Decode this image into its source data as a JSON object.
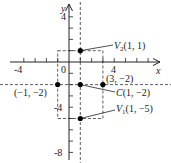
{
  "figure": {
    "type": "coordinate-graph",
    "axes": {
      "x_label": "x",
      "y_label": "y",
      "origin_label": "0",
      "x_ticks_labeled": [
        "-4",
        "4"
      ],
      "y_ticks_labeled": [
        "4",
        "-4",
        "-8"
      ],
      "x_range": [
        -5,
        6
      ],
      "y_range": [
        -9,
        5
      ]
    },
    "points": [
      {
        "name": "V2",
        "label": "V2(1, 1)",
        "sub_main": "V",
        "sub": "2",
        "coords": "(1, 1)",
        "x": 1,
        "y": 1
      },
      {
        "name": "C",
        "label": "C(1, −2)",
        "sub_main": "C",
        "coords": "(1, −2)",
        "x": 1,
        "y": -2
      },
      {
        "name": "V1",
        "label": "V1(1, −5)",
        "sub_main": "V",
        "sub": "1",
        "coords": "(1, −5)",
        "x": 1,
        "y": -5
      },
      {
        "name": "left",
        "label": "(−1, −2)",
        "x": -1,
        "y": -2
      },
      {
        "name": "right",
        "label": "(3, −2)",
        "x": 3,
        "y": -2
      }
    ],
    "guides": {
      "vertical_dashed_x": 1,
      "horizontal_dashed_y": -2,
      "dashed_rect": {
        "x1": -1,
        "x2": 3,
        "y1": 1,
        "y2": -5
      }
    }
  }
}
